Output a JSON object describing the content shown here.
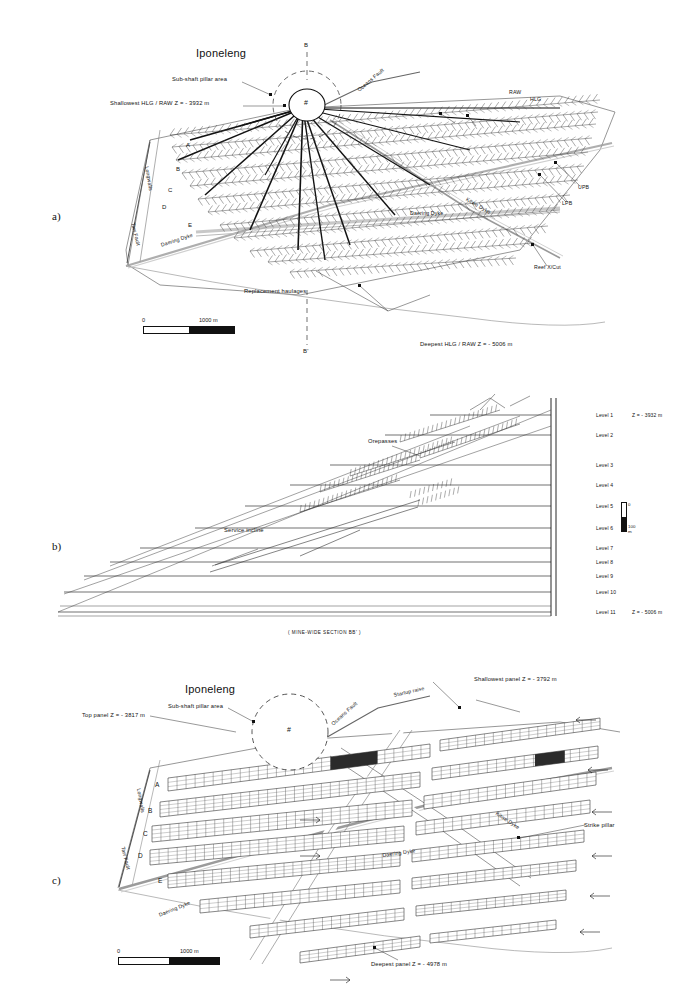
{
  "figure": {
    "panels": [
      "a)",
      "b)",
      "c)"
    ]
  },
  "panel_a": {
    "label": "a)",
    "shaft_name": "Iponeleng",
    "shaft_symbol": "#",
    "section_top": "B",
    "section_bottom": "B'",
    "annotations": {
      "sub_shaft": "Sub-shaft pillar area",
      "shallowest": "Shallowest HLG / RAW  Z = - 3932 m",
      "deepest": "Deepest HLG / RAW  Z = - 5006 m",
      "replacement": "Replacement haulages",
      "raw": "RAW",
      "hlg": "HLG",
      "upb": "UPB",
      "lpb": "LPB",
      "reef_xcut": "Reef X/Cut",
      "daering_dyke": "Daering Dyke",
      "daering_dyke2": "Daering Dyke",
      "kitwe_dyke": "Kitwe Dyke",
      "oceans_fault": "Oceans Fault",
      "tarr_fault": "Tarr Fault",
      "longwalls": "Longwalls"
    },
    "longwall_letters": [
      "A",
      "B",
      "C",
      "D",
      "E"
    ],
    "scale": {
      "zero": "0",
      "value": "1000 m"
    }
  },
  "panel_b": {
    "label": "b)",
    "caption": "( MINE-WIDE  SECTION  BB' )",
    "annotations": {
      "orepasses": "Orepasses",
      "service_incline": "Service incline"
    },
    "levels": [
      {
        "name": "Level 1",
        "depth": "Z = - 3932 m"
      },
      {
        "name": "Level 2",
        "depth": ""
      },
      {
        "name": "Level 3",
        "depth": ""
      },
      {
        "name": "Level 4",
        "depth": ""
      },
      {
        "name": "Level 5",
        "depth": ""
      },
      {
        "name": "Level 6",
        "depth": ""
      },
      {
        "name": "Level 7",
        "depth": ""
      },
      {
        "name": "Level 8",
        "depth": ""
      },
      {
        "name": "Level 9",
        "depth": ""
      },
      {
        "name": "Level 10",
        "depth": ""
      },
      {
        "name": "Level 11",
        "depth": "Z = - 5006 m"
      }
    ],
    "scale": {
      "zero": "0",
      "value": "100 m"
    }
  },
  "panel_c": {
    "label": "c)",
    "shaft_name": "Iponeleng",
    "shaft_symbol": "#",
    "annotations": {
      "sub_shaft": "Sub-shaft pillar area",
      "top_panel": "Top panel  Z = - 3817 m",
      "shallowest_panel": "Shallowest panel  Z = - 3792 m",
      "deepest_panel": "Deepest panel  Z = - 4978 m",
      "startup_raise": "Startup raise",
      "strike_pillar": "Strike pillar",
      "daering_dyke": "Daering Dyke",
      "daering_dyke2": "Daering Dyke",
      "kitwe_dyke": "Kitwe Dyke",
      "oceans_fault": "Oceans Fault",
      "tarr_fault": "Tarr Fault",
      "longwalls": "Longwalls"
    },
    "longwall_letters": [
      "A",
      "B",
      "C",
      "D",
      "E"
    ],
    "scale": {
      "zero": "0",
      "value": "1000 m"
    }
  },
  "colors": {
    "ink": "#111111",
    "paper": "#ffffff",
    "grey": "#7a7a7a",
    "lightgrey": "#b5b5b5"
  }
}
